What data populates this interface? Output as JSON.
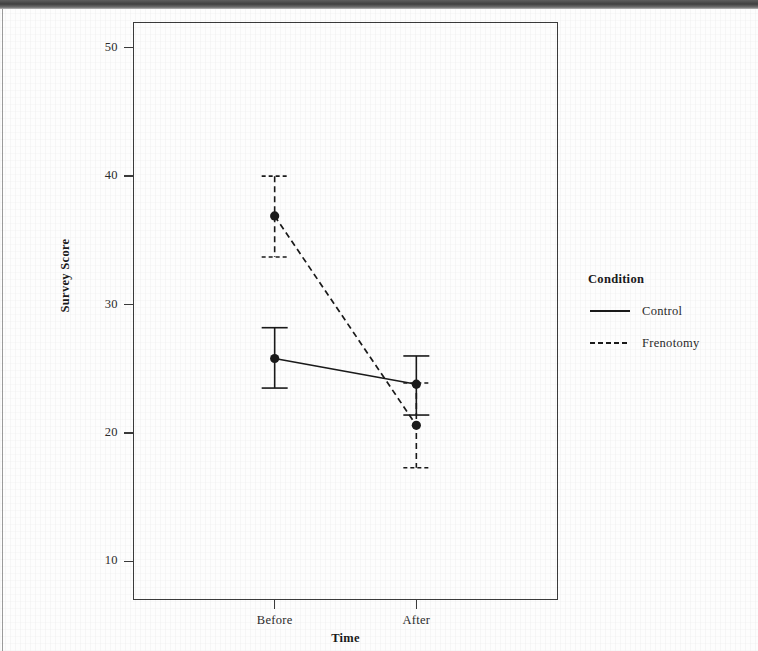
{
  "figure": {
    "panel": {
      "left": 133,
      "top": 22,
      "width": 425,
      "height": 578
    },
    "colors": {
      "ink": "#1a1a1a",
      "axis": "#3a3a3a",
      "text": "#2b2b2b",
      "background": "#ffffff"
    }
  },
  "legend": {
    "title": "Condition",
    "entries": [
      {
        "label": "Control",
        "style": "solid",
        "key_name": "legend-key-control"
      },
      {
        "label": "Frenotomy",
        "style": "dashed",
        "key_name": "legend-key-frenotomy"
      }
    ]
  },
  "axes": {
    "x_title": "Time",
    "y_title": "Survey Score",
    "x_tick_labels": [
      "Before",
      "After"
    ],
    "y_tick_labels": [
      "10",
      "20",
      "30",
      "40",
      "50"
    ]
  },
  "chart_data": {
    "type": "line",
    "title": "",
    "subtitle": "",
    "xlabel": "Time",
    "ylabel": "Survey Score",
    "categories": [
      "Before",
      "After"
    ],
    "x": [
      0,
      1
    ],
    "ylim": [
      7,
      52
    ],
    "yticks": [
      10,
      20,
      30,
      40,
      50
    ],
    "grid": false,
    "legend_position": "right",
    "legend_title": "Condition",
    "error_bars": "95% confidence interval",
    "markers": "filled circle",
    "series": [
      {
        "name": "Control",
        "linestyle": "solid",
        "color": "#1a1a1a",
        "values": [
          25.8,
          23.8
        ],
        "ci_lower": [
          23.5,
          21.4
        ],
        "ci_upper": [
          28.2,
          26.0
        ]
      },
      {
        "name": "Frenotomy",
        "linestyle": "dashed",
        "color": "#1a1a1a",
        "values": [
          36.9,
          20.6
        ],
        "ci_lower": [
          33.7,
          17.3
        ],
        "ci_upper": [
          40.0,
          23.9
        ]
      }
    ]
  }
}
